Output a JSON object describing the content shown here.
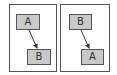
{
  "panels": [
    {
      "nodes": [
        {
          "label": "A",
          "role": "source"
        },
        {
          "label": "B",
          "role": "target"
        }
      ],
      "edge": {
        "from": "A",
        "to": "B"
      }
    },
    {
      "nodes": [
        {
          "label": "B",
          "role": "source"
        },
        {
          "label": "A",
          "role": "target"
        }
      ],
      "edge": {
        "from": "B",
        "to": "A"
      }
    }
  ],
  "colors": {
    "node_fill": "#c9c9c9",
    "stroke": "#555555",
    "background": "#ffffff"
  }
}
